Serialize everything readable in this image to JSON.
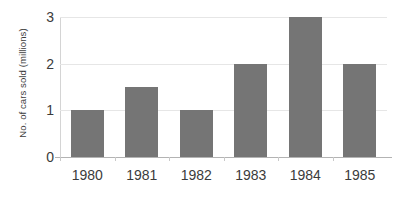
{
  "chart_data": {
    "type": "bar",
    "title": "",
    "subtitle": "",
    "xlabel": "",
    "ylabel": "No. of cars sold (millions)",
    "categories": [
      "1980",
      "1981",
      "1982",
      "1983",
      "1984",
      "1985"
    ],
    "values": [
      1,
      1.5,
      1,
      2,
      3,
      2
    ],
    "series": [
      {
        "name": "No. of cars sold (millions)",
        "values": [
          1,
          1.5,
          1,
          2,
          3,
          2
        ]
      }
    ],
    "ylim": [
      0,
      3
    ],
    "xlim": null,
    "y_ticks": [
      "0",
      "1",
      "2",
      "3"
    ],
    "y_tick_values": [
      0,
      1,
      2,
      3
    ],
    "grid": true,
    "grid_axis": "y",
    "legend": false,
    "legend_position": "none",
    "annotations": [],
    "colors": {
      "bar": "#757575",
      "gridline": "#e6e6e6",
      "axis": "#b3b3b3",
      "text": "#3b3b3b",
      "background": "#ffffff"
    }
  }
}
